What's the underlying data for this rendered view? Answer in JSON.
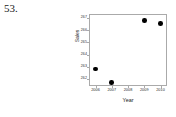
{
  "figure": {
    "number_label": "53."
  },
  "chart_data": {
    "type": "scatter",
    "title": "",
    "xlabel": "Year",
    "ylabel": "Sales",
    "x": [
      2006,
      2007,
      2009,
      2010
    ],
    "values": [
      262.8,
      261.7,
      266.8,
      266.55
    ],
    "points": [
      {
        "x": 2006,
        "y": 262.8
      },
      {
        "x": 2007,
        "y": 261.7
      },
      {
        "x": 2009,
        "y": 266.8
      },
      {
        "x": 2010,
        "y": 266.55
      }
    ],
    "xticks": [
      2006,
      2007,
      2008,
      2009,
      2010
    ],
    "xtick_labels": [
      "2006",
      "2007",
      "2008",
      "2009",
      "2010"
    ],
    "yticks": [
      262,
      263,
      264,
      265,
      266,
      267
    ],
    "ytick_labels": [
      "262",
      "263",
      "264",
      "265",
      "266",
      "267"
    ],
    "xlim": [
      2005.6,
      2010.4
    ],
    "ylim": [
      261.4,
      267.35
    ],
    "grid": false,
    "legend": false,
    "marker": "filled-circle",
    "marker_color": "#000000",
    "frame_color": "#aaaaaa"
  }
}
